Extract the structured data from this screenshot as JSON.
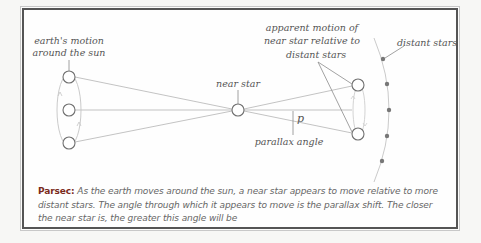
{
  "diagram": {
    "labels": {
      "earth_motion_line1": "earth's motion",
      "earth_motion_line2": "around the sun",
      "near_star": "near star",
      "apparent_line1": "apparent motion of",
      "apparent_line2": "near star relative to",
      "apparent_line3": "distant stars",
      "distant_stars": "distant stars",
      "p": "p",
      "parallax_angle": "parallax angle"
    },
    "colors": {
      "line": "#b8b8b8",
      "circle_stroke": "#707070",
      "dot": "#777777",
      "term": "#7a2a20"
    }
  },
  "caption": {
    "term": "Parsec:",
    "text": " As the earth moves around the sun, a near star appears to move relative to more distant stars. The angle through which it appears to move is the parallax shift. The closer the near star is, the greater this angle will be"
  }
}
